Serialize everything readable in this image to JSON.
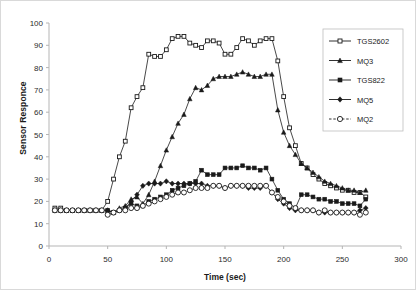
{
  "chart_data": {
    "type": "line",
    "title": "",
    "xlabel": "Time (sec)",
    "ylabel": "Sensor Responce",
    "xlim": [
      0,
      300
    ],
    "ylim": [
      0,
      100
    ],
    "xticks": [
      0,
      50,
      100,
      150,
      200,
      250,
      300
    ],
    "yticks": [
      0,
      10,
      20,
      30,
      40,
      50,
      60,
      70,
      80,
      90,
      100
    ],
    "grid": false,
    "legend_position": "right-top",
    "x": [
      5,
      10,
      15,
      20,
      25,
      30,
      35,
      40,
      45,
      50,
      55,
      60,
      65,
      70,
      75,
      80,
      85,
      90,
      95,
      100,
      105,
      110,
      115,
      120,
      125,
      130,
      135,
      140,
      145,
      150,
      155,
      160,
      165,
      170,
      175,
      180,
      185,
      190,
      195,
      200,
      205,
      210,
      215,
      220,
      225,
      230,
      235,
      240,
      245,
      250,
      255,
      260,
      265,
      270
    ],
    "series": [
      {
        "name": "TGS2602",
        "marker": "open-square",
        "line": "solid",
        "color": "#1a1a1a",
        "values": [
          17,
          17,
          16,
          16,
          16,
          16,
          16,
          16,
          16,
          20,
          30,
          40,
          47,
          62,
          67,
          71,
          86,
          85,
          85,
          88,
          93,
          94,
          94,
          91,
          90,
          89,
          92,
          92,
          91,
          86,
          86,
          89,
          93,
          92,
          90,
          92,
          93,
          93,
          83,
          67,
          53,
          45,
          37,
          35,
          32,
          30,
          28,
          27,
          26,
          25,
          25,
          24,
          24,
          22
        ]
      },
      {
        "name": "MQ3",
        "marker": "filled-triangle",
        "line": "solid",
        "color": "#1a1a1a",
        "values": [
          16,
          16,
          16,
          16,
          16,
          16,
          16,
          16,
          16,
          16,
          15,
          17,
          18,
          21,
          22,
          19,
          23,
          29,
          36,
          43,
          49,
          55,
          59,
          66,
          71,
          70,
          72,
          75,
          76,
          76,
          76,
          77,
          78,
          77,
          76,
          76,
          77,
          77,
          61,
          51,
          45,
          41,
          37,
          35,
          33,
          31,
          29,
          28,
          27,
          26,
          25,
          25,
          24,
          25
        ]
      },
      {
        "name": "TGS822",
        "marker": "filled-square",
        "line": "solid",
        "color": "#1a1a1a",
        "values": [
          16,
          16,
          16,
          16,
          16,
          16,
          16,
          16,
          16,
          16,
          15,
          16,
          17,
          19,
          18,
          18,
          20,
          21,
          22,
          23,
          25,
          26,
          27,
          28,
          29,
          34,
          32,
          32,
          32,
          35,
          35,
          35,
          36,
          35,
          35,
          34,
          35,
          30,
          25,
          21,
          19,
          17,
          23,
          23,
          22,
          21,
          21,
          20,
          20,
          19,
          19,
          19,
          18,
          21
        ]
      },
      {
        "name": "MQ5",
        "marker": "filled-diamond",
        "line": "solid",
        "color": "#1a1a1a",
        "values": [
          16,
          16,
          16,
          16,
          16,
          16,
          16,
          16,
          16,
          16,
          15,
          16,
          17,
          20,
          23,
          27,
          28,
          28,
          28,
          29,
          28,
          28,
          28,
          28,
          28,
          28,
          27,
          27,
          27,
          26,
          27,
          27,
          27,
          26,
          26,
          26,
          27,
          24,
          21,
          19,
          17,
          16,
          16,
          16,
          16,
          15,
          15,
          15,
          15,
          15,
          15,
          15,
          16,
          17
        ]
      },
      {
        "name": "MQ2",
        "marker": "open-circle",
        "line": "dashed",
        "color": "#1a1a1a",
        "values": [
          16,
          16,
          16,
          16,
          16,
          16,
          16,
          16,
          16,
          14,
          15,
          16,
          16,
          17,
          17,
          18,
          19,
          20,
          21,
          22,
          23,
          24,
          24,
          25,
          26,
          26,
          26,
          27,
          27,
          26,
          27,
          27,
          27,
          27,
          27,
          27,
          27,
          24,
          22,
          20,
          18,
          17,
          16,
          16,
          16,
          15,
          16,
          15,
          15,
          15,
          15,
          15,
          14,
          15
        ]
      }
    ]
  }
}
